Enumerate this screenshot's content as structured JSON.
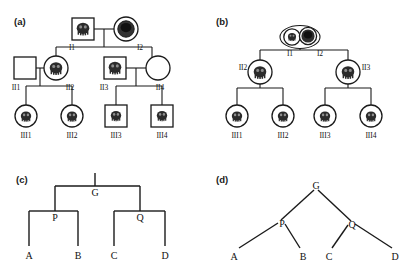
{
  "figure": {
    "background": "#ffffff",
    "ink": "#1a1a1a",
    "affected_fill": "#2b2b2b"
  },
  "panels": [
    {
      "key": "a",
      "label": "(a)",
      "type": "pedigree",
      "description": "Three-generation pedigree with square (male) and circle (female) symbols; affected individuals are filled.",
      "individuals": [
        {
          "id": "I1",
          "label": "I1",
          "shape": "square",
          "affected": true,
          "generation": 1
        },
        {
          "id": "I2",
          "label": "I2",
          "shape": "circle",
          "affected": true,
          "generation": 1
        },
        {
          "id": "II1",
          "label": "II1",
          "shape": "square",
          "affected": false,
          "generation": 2
        },
        {
          "id": "II2",
          "label": "II2",
          "shape": "circle",
          "affected": true,
          "generation": 2
        },
        {
          "id": "II3",
          "label": "II3",
          "shape": "square",
          "affected": true,
          "generation": 2
        },
        {
          "id": "II4",
          "label": "II4",
          "shape": "circle",
          "affected": false,
          "generation": 2
        },
        {
          "id": "III1",
          "label": "III1",
          "shape": "circle",
          "affected": true,
          "generation": 3
        },
        {
          "id": "III2",
          "label": "III2",
          "shape": "circle",
          "affected": true,
          "generation": 3
        },
        {
          "id": "III3",
          "label": "III3",
          "shape": "square",
          "affected": true,
          "generation": 3
        },
        {
          "id": "III4",
          "label": "III4",
          "shape": "square",
          "affected": true,
          "generation": 3
        }
      ],
      "matings": [
        {
          "partners": [
            "I1",
            "I2"
          ],
          "children": [
            "II2",
            "II3"
          ]
        },
        {
          "partners": [
            "II1",
            "II2"
          ],
          "children": [
            "III1",
            "III2"
          ]
        },
        {
          "partners": [
            "II3",
            "II4"
          ],
          "children": [
            "III3",
            "III4"
          ]
        }
      ]
    },
    {
      "key": "b",
      "label": "(b)",
      "type": "pedigree",
      "description": "Same family redrawn with all individuals as circles; founders I1 and I2 are enclosed together in a single mating ellipse.",
      "individuals": [
        {
          "id": "I1",
          "label": "I1",
          "shape": "circle",
          "affected": true,
          "generation": 1
        },
        {
          "id": "I2",
          "label": "I2",
          "shape": "circle",
          "affected": true,
          "generation": 1
        },
        {
          "id": "II2",
          "label": "II2",
          "shape": "circle",
          "affected": true,
          "generation": 2
        },
        {
          "id": "II3",
          "label": "II3",
          "shape": "circle",
          "affected": true,
          "generation": 2
        },
        {
          "id": "III1",
          "label": "III1",
          "shape": "circle",
          "affected": true,
          "generation": 3
        },
        {
          "id": "III2",
          "label": "III2",
          "shape": "circle",
          "affected": true,
          "generation": 3
        },
        {
          "id": "III3",
          "label": "III3",
          "shape": "circle",
          "affected": true,
          "generation": 3
        },
        {
          "id": "III4",
          "label": "III4",
          "shape": "circle",
          "affected": true,
          "generation": 3
        }
      ],
      "matings": [
        {
          "partners": [
            "I1",
            "I2"
          ],
          "children": [
            "II2",
            "II3"
          ]
        },
        {
          "partners": [
            "II2"
          ],
          "children": [
            "III1",
            "III2"
          ]
        },
        {
          "partners": [
            "II3"
          ],
          "children": [
            "III3",
            "III4"
          ]
        }
      ]
    },
    {
      "key": "c",
      "label": "(c)",
      "type": "tree-orthogonal",
      "description": "Rectangular (orthogonal) genealogy tree with root G, internal nodes P and Q, leaves A, B, C, D.",
      "root": "G",
      "nodes": [
        {
          "id": "G",
          "label": "G"
        },
        {
          "id": "P",
          "label": "P"
        },
        {
          "id": "Q",
          "label": "Q"
        },
        {
          "id": "A",
          "label": "A"
        },
        {
          "id": "B",
          "label": "B"
        },
        {
          "id": "C",
          "label": "C"
        },
        {
          "id": "D",
          "label": "D"
        }
      ],
      "edges": [
        {
          "from": "G",
          "to": "P"
        },
        {
          "from": "G",
          "to": "Q"
        },
        {
          "from": "P",
          "to": "A"
        },
        {
          "from": "P",
          "to": "B"
        },
        {
          "from": "Q",
          "to": "C"
        },
        {
          "from": "Q",
          "to": "D"
        }
      ]
    },
    {
      "key": "d",
      "label": "(d)",
      "type": "tree-diagonal",
      "description": "Slanted (diagonal) genealogy tree with root G, internal nodes P and Q, leaves A, B, C, D.",
      "root": "G",
      "nodes": [
        {
          "id": "G",
          "label": "G"
        },
        {
          "id": "P",
          "label": "P"
        },
        {
          "id": "Q",
          "label": "Q"
        },
        {
          "id": "A",
          "label": "A"
        },
        {
          "id": "B",
          "label": "B"
        },
        {
          "id": "C",
          "label": "C"
        },
        {
          "id": "D",
          "label": "D"
        }
      ],
      "edges": [
        {
          "from": "G",
          "to": "P"
        },
        {
          "from": "G",
          "to": "Q"
        },
        {
          "from": "P",
          "to": "A"
        },
        {
          "from": "P",
          "to": "B"
        },
        {
          "from": "Q",
          "to": "C"
        },
        {
          "from": "Q",
          "to": "D"
        }
      ]
    }
  ]
}
